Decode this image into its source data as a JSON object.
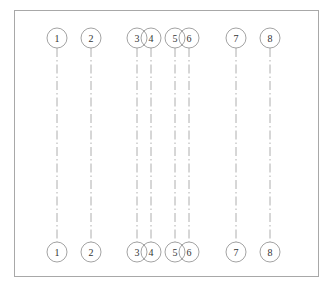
{
  "diagram": {
    "type": "structural-grid-axes",
    "frame": {
      "x": 14,
      "y": 10,
      "width": 304,
      "height": 266
    },
    "bubble_radius": 10,
    "top_y": 38,
    "bottom_y": 252,
    "axes": [
      {
        "label": "1",
        "x": 57
      },
      {
        "label": "2",
        "x": 91
      },
      {
        "label": "3",
        "x": 137
      },
      {
        "label": "4",
        "x": 151
      },
      {
        "label": "5",
        "x": 175
      },
      {
        "label": "6",
        "x": 189
      },
      {
        "label": "7",
        "x": 236
      },
      {
        "label": "8",
        "x": 270
      }
    ]
  }
}
